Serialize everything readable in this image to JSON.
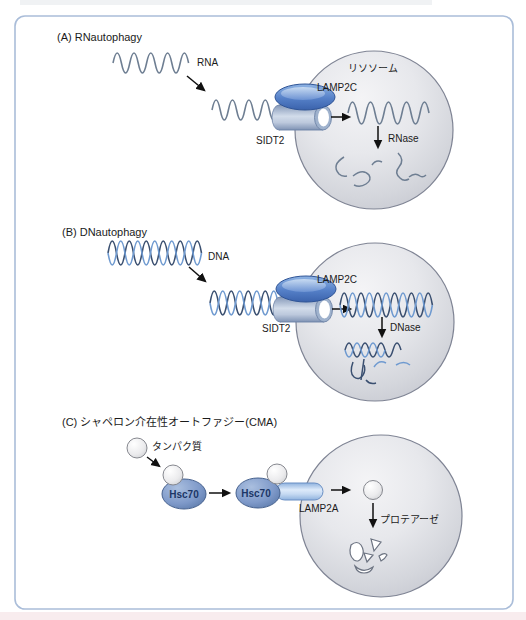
{
  "panel_a": {
    "title": "(A) RNautophagy",
    "substrate_label": "RNA",
    "lysosome_label": "リソソーム",
    "receptor_label": "LAMP2C",
    "transporter_label": "SIDT2",
    "enzyme_label": "RNase"
  },
  "panel_b": {
    "title": "(B) DNautophagy",
    "substrate_label": "DNA",
    "receptor_label": "LAMP2C",
    "transporter_label": "SIDT2",
    "enzyme_label": "DNase"
  },
  "panel_c": {
    "title": "(C) シャペロン介在性オートファジー(CMA)",
    "substrate_label": "タンパク質",
    "chaperone_label": "Hsc70",
    "membrane_chaperone_label": "Hsc70",
    "receptor_label": "LAMP2A",
    "enzyme_label": "プロテアーゼ"
  },
  "colors": {
    "frame_border": "#aabdd9",
    "lysosome_fill": "#e2e3e8",
    "lysosome_stroke": "#7f8494",
    "lamp2c_blue": "#5580c8",
    "sidt2_gray_blue": "#aebdd4",
    "rna_stroke": "#6e7e92",
    "dna_dark": "#3a4f70",
    "dna_light": "#6f9ad0",
    "hsc70_fill": "#7e99c9",
    "lamp2a_fill": "#bdd5f0",
    "arrow": "#111111"
  }
}
